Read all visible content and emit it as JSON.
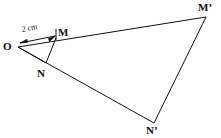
{
  "figure": {
    "background_color": "#ffffff",
    "stroke_color": "#111111",
    "stroke_width": 1,
    "canvas": {
      "width": 221,
      "height": 138
    }
  },
  "points": {
    "O": {
      "label": "O",
      "x": 18,
      "y": 47
    },
    "M": {
      "label": "M",
      "x": 56,
      "y": 38
    },
    "N": {
      "label": "N",
      "x": 46,
      "y": 63
    },
    "Mp": {
      "label": "M’",
      "x": 206,
      "y": 17
    },
    "Np": {
      "label": "N’",
      "x": 154,
      "y": 123
    }
  },
  "segments": [
    {
      "name": "O-Mp",
      "from": "O",
      "to": "Mp"
    },
    {
      "name": "O-Np",
      "from": "O",
      "to": "Np"
    },
    {
      "name": "Mp-Np",
      "from": "Mp",
      "to": "Np"
    },
    {
      "name": "M-N",
      "from": "M",
      "to": "N"
    },
    {
      "name": "O-N",
      "from": "O",
      "to": "N"
    }
  ],
  "dimension": {
    "label": "2 cm",
    "from": "O",
    "to": "M",
    "style": "double-headed-arrow",
    "tick_at": "M"
  }
}
